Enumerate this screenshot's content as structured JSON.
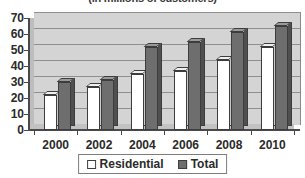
{
  "chart_data": {
    "type": "bar",
    "title": "(in millions of customers)",
    "xlabel": "",
    "ylabel": "",
    "ylim": [
      0,
      70
    ],
    "yticks": [
      0,
      10,
      20,
      30,
      40,
      50,
      60,
      70
    ],
    "grid": true,
    "legend_position": "bottom",
    "categories": [
      "2000",
      "2002",
      "2004",
      "2006",
      "2008",
      "2010"
    ],
    "series": [
      {
        "name": "Residential",
        "color": "#ffffff",
        "values": [
          22,
          27,
          35,
          37,
          44,
          52
        ]
      },
      {
        "name": "Total",
        "color": "#6e6e6e",
        "values": [
          30,
          31,
          52,
          55,
          61,
          65
        ]
      }
    ]
  },
  "legend": {
    "items": [
      {
        "label": "Residential",
        "swatch": "residential"
      },
      {
        "label": "Total",
        "swatch": "total"
      }
    ]
  }
}
